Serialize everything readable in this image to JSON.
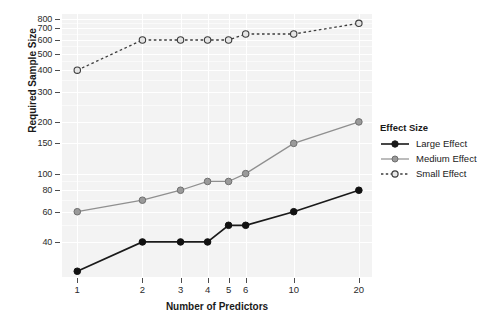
{
  "chart_data": {
    "type": "line",
    "title": "",
    "xlabel": "Number of Predictors",
    "ylabel": "Required Sample Size",
    "x_scale": "log",
    "y_scale": "log",
    "grid": true,
    "legend_position": "right",
    "legend_title": "Effect Size",
    "categories": [
      1,
      2,
      3,
      4,
      5,
      6,
      10,
      20
    ],
    "x_tick_labels": [
      "1",
      "2",
      "3",
      "4",
      "5",
      "6",
      "10",
      "20"
    ],
    "y_tick_labels": [
      "40",
      "60",
      "80",
      "100",
      "150",
      "200",
      "300",
      "400",
      "500",
      "600",
      "700",
      "800"
    ],
    "y_tick_values": [
      40,
      60,
      80,
      100,
      150,
      200,
      300,
      400,
      500,
      600,
      700,
      800
    ],
    "ylim": [
      25,
      850
    ],
    "xlim": [
      0.85,
      23
    ],
    "series": [
      {
        "name": "Large Effect",
        "values": [
          27,
          40,
          40,
          40,
          50,
          50,
          60,
          80
        ],
        "color": "#1a1a1a",
        "line_style": "solid",
        "marker": "filled-circle"
      },
      {
        "name": "Medium Effect",
        "values": [
          60,
          70,
          80,
          90,
          90,
          100,
          150,
          200
        ],
        "color": "#8f8f8f",
        "line_style": "solid",
        "marker": "filled-circle-gray"
      },
      {
        "name": "Small Effect",
        "values": [
          400,
          600,
          600,
          600,
          600,
          650,
          650,
          750
        ],
        "color": "#3d3d3d",
        "line_style": "dashed",
        "marker": "open-circle"
      }
    ]
  },
  "legend": {
    "title": "Effect Size",
    "entries": [
      {
        "label": "Large Effect"
      },
      {
        "label": "Medium Effect"
      },
      {
        "label": "Small Effect"
      }
    ]
  },
  "colors": {
    "panel_background": "#f3f3f3",
    "gridline": "#ffffff",
    "large_effect": "#1a1a1a",
    "medium_effect": "#8f8f8f",
    "small_effect": "#3d3d3d",
    "text": "#1a1a1a"
  }
}
